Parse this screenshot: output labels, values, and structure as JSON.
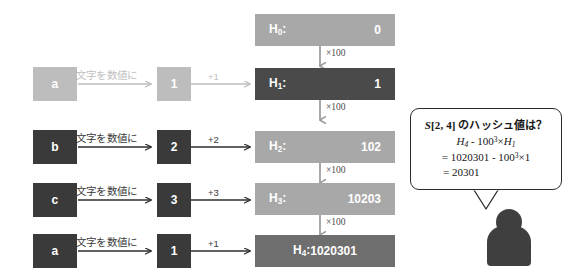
{
  "diagram": {
    "title_concept": "rolling-hash-construction",
    "char_to_num_label": "文字を数値に",
    "multiply_label": "×100",
    "colors": {
      "letter_box_dark": "#3a3a3a",
      "num_box_dark": "#3a3a3a",
      "h_box_light": "#a8a8a8",
      "h_box_dark": "#4a4a4a",
      "h_box_mid": "#6e6e6e",
      "arrow": "#2e2e2e",
      "callout_border": "#2b2b2b",
      "person": "#3f3f3f",
      "faded": "#bdbdbd"
    },
    "rows": [
      {
        "faded": true,
        "letter": "a",
        "convert_label": "文字を数値に",
        "number": "1",
        "add_label": "+1"
      },
      {
        "faded": false,
        "letter": "b",
        "convert_label": "文字を数値に",
        "number": "2",
        "add_label": "+2"
      },
      {
        "faded": false,
        "letter": "c",
        "convert_label": "文字を数値に",
        "number": "3",
        "add_label": "+3"
      },
      {
        "faded": false,
        "letter": "a",
        "convert_label": "文字を数値に",
        "number": "1",
        "add_label": "+1"
      }
    ],
    "hash_boxes": [
      {
        "label_base": "H",
        "label_sub": "0",
        "value": "0",
        "style": "light",
        "layout": "split"
      },
      {
        "label_base": "H",
        "label_sub": "1",
        "value": "1",
        "style": "dark",
        "layout": "split"
      },
      {
        "label_base": "H",
        "label_sub": "2",
        "value": "102",
        "style": "light",
        "layout": "split"
      },
      {
        "label_base": "H",
        "label_sub": "3",
        "value": "10203",
        "style": "light",
        "layout": "split"
      },
      {
        "label_base": "H",
        "label_sub": "4",
        "value": "1020301",
        "style": "mid",
        "layout": "center"
      }
    ],
    "multiply_labels": [
      "×100",
      "×100",
      "×100",
      "×100"
    ]
  },
  "callout": {
    "line1": "S[2, 4] のハッシュ値は？",
    "line1_parts": {
      "var": "S",
      "range": "[2, 4]",
      "rest": " のハッシュ値は？"
    },
    "line2_h_base": "H",
    "line2_h_sub": "4",
    "line2_minus": " - 100",
    "line2_pow": "3",
    "line2_times": "×",
    "line2_h2_base": "H",
    "line2_h2_sub": "1",
    "line3_eq": "= 1020301 - 100",
    "line3_pow": "3",
    "line3_times": "×",
    "line3_one": "1",
    "line4": "= 20301"
  }
}
